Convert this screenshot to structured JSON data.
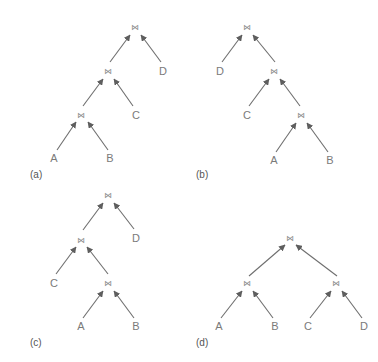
{
  "figure": {
    "join_symbol": "⋈",
    "colors": {
      "edge": "#6e6e6e",
      "label": "#7a7a7a",
      "caption": "#555555",
      "background": "#ffffff"
    },
    "trees": [
      {
        "caption": "(a)",
        "caption_pos": [
          30,
          178
        ],
        "joins": [
          [
            135,
            27
          ],
          [
            108,
            71
          ],
          [
            81,
            115
          ]
        ],
        "leaves": [
          {
            "label": "A",
            "pos": [
              54,
              162
            ]
          },
          {
            "label": "B",
            "pos": [
              110,
              162
            ]
          },
          {
            "label": "C",
            "pos": [
              136,
              119
            ]
          },
          {
            "label": "D",
            "pos": [
              163,
              75
            ]
          }
        ],
        "edges": [
          [
            [
              57,
              150
            ],
            [
              76,
              122
            ]
          ],
          [
            [
              108,
              150
            ],
            [
              88,
              122
            ]
          ],
          [
            [
              83,
              106
            ],
            [
              103,
              79
            ]
          ],
          [
            [
              133,
              106
            ],
            [
              114,
              79
            ]
          ],
          [
            [
              110,
              62
            ],
            [
              130,
              35
            ]
          ],
          [
            [
              161,
              62
            ],
            [
              141,
              35
            ]
          ]
        ]
      },
      {
        "caption": "(b)",
        "caption_pos": [
          196,
          178
        ],
        "joins": [
          [
            247,
            27
          ],
          [
            274,
            71
          ],
          [
            301,
            115
          ]
        ],
        "leaves": [
          {
            "label": "D",
            "pos": [
              220,
              75
            ]
          },
          {
            "label": "C",
            "pos": [
              247,
              119
            ]
          },
          {
            "label": "A",
            "pos": [
              274,
              164
            ]
          },
          {
            "label": "B",
            "pos": [
              330,
              164
            ]
          }
        ],
        "edges": [
          [
            [
              222,
              62
            ],
            [
              242,
              35
            ]
          ],
          [
            [
              275,
              62
            ],
            [
              253,
              35
            ]
          ],
          [
            [
              249,
              106
            ],
            [
              269,
              79
            ]
          ],
          [
            [
              300,
              106
            ],
            [
              280,
              79
            ]
          ],
          [
            [
              276,
              152
            ],
            [
              296,
              123
            ]
          ],
          [
            [
              328,
              152
            ],
            [
              307,
              123
            ]
          ]
        ]
      },
      {
        "caption": "(c)",
        "caption_pos": [
          30,
          346
        ],
        "joins": [
          [
            108,
            195
          ],
          [
            81,
            240
          ],
          [
            108,
            283
          ]
        ],
        "leaves": [
          {
            "label": "D",
            "pos": [
              136,
              242
            ]
          },
          {
            "label": "C",
            "pos": [
              54,
              287
            ]
          },
          {
            "label": "A",
            "pos": [
              81,
              330
            ]
          },
          {
            "label": "B",
            "pos": [
              136,
              330
            ]
          }
        ],
        "edges": [
          [
            [
              83,
              230
            ],
            [
              103,
              203
            ]
          ],
          [
            [
              134,
              229
            ],
            [
              114,
              203
            ]
          ],
          [
            [
              56,
              274
            ],
            [
              76,
              247
            ]
          ],
          [
            [
              108,
              274
            ],
            [
              87,
              247
            ]
          ],
          [
            [
              83,
              318
            ],
            [
              103,
              291
            ]
          ],
          [
            [
              134,
              318
            ],
            [
              114,
              291
            ]
          ]
        ]
      },
      {
        "caption": "(d)",
        "caption_pos": [
          196,
          346
        ],
        "joins": [
          [
            290,
            238
          ],
          [
            247,
            283
          ],
          [
            336,
            283
          ]
        ],
        "leaves": [
          {
            "label": "A",
            "pos": [
              219,
              330
            ]
          },
          {
            "label": "B",
            "pos": [
              275,
              330
            ]
          },
          {
            "label": "C",
            "pos": [
              308,
              330
            ]
          },
          {
            "label": "D",
            "pos": [
              364,
              330
            ]
          }
        ],
        "edges": [
          [
            [
              249,
              276
            ],
            [
              285,
              245
            ]
          ],
          [
            [
              337,
              276
            ],
            [
              296,
              245
            ]
          ],
          [
            [
              221,
              318
            ],
            [
              242,
              291
            ]
          ],
          [
            [
              273,
              318
            ],
            [
              253,
              291
            ]
          ],
          [
            [
              310,
              318
            ],
            [
              331,
              291
            ]
          ],
          [
            [
              362,
              318
            ],
            [
              342,
              291
            ]
          ]
        ]
      }
    ]
  }
}
